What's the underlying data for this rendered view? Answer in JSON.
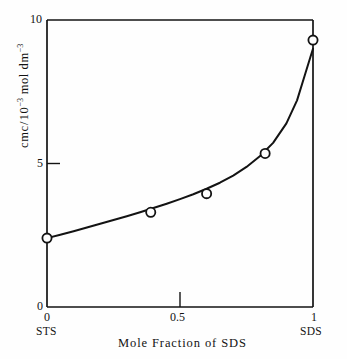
{
  "figure": {
    "background_color": "#fefefe",
    "ink_color": "#131313"
  },
  "axes": {
    "y": {
      "label_prefix": "cmc",
      "label_slash": "/",
      "label_mantissa": "10",
      "label_exponent": "−3",
      "label_unit": " mol dm",
      "label_unit_exponent": "−3",
      "label_plain": "cmc/10−3 mol dm−3",
      "ticks": [
        "0",
        "5",
        "10"
      ],
      "tick_values": [
        0,
        5,
        10
      ],
      "tick_10": "10",
      "tick_5": "5",
      "tick_0": "0",
      "range": [
        0,
        10
      ]
    },
    "x": {
      "label": "Mole Fraction of SDS",
      "ticks": [
        "0",
        "0.5",
        "1"
      ],
      "tick_values": [
        0,
        0.5,
        1
      ],
      "tick_0": "0",
      "tick_05": "0.5",
      "tick_1": "1",
      "endpoint_left": "STS",
      "endpoint_right": "SDS",
      "range": [
        0,
        1
      ]
    }
  },
  "chart_data": {
    "type": "scatter",
    "title": "",
    "xlabel": "Mole Fraction of SDS",
    "ylabel": "cmc/10−3 mol dm−3",
    "xlim": [
      0,
      1
    ],
    "ylim": [
      0,
      10
    ],
    "xticks": [
      0,
      0.5,
      1
    ],
    "xticklabels": [
      "0",
      "0.5",
      "1"
    ],
    "yticks": [
      0,
      5,
      10
    ],
    "yticklabels": [
      "0",
      "5",
      "10"
    ],
    "x_endpoint_labels": {
      "left": "STS",
      "right": "SDS"
    },
    "grid": false,
    "legend": null,
    "marker": "open-circle",
    "series": [
      {
        "name": "cmc of STS/SDS mixtures",
        "marker": "open-circle",
        "x": [
          0.0,
          0.39,
          0.6,
          0.82,
          1.0
        ],
        "y": [
          2.4,
          3.3,
          3.95,
          5.35,
          9.3
        ]
      }
    ],
    "fitted_curve": {
      "name": "smooth fitted curve",
      "x": [
        0.0,
        0.05,
        0.1,
        0.15,
        0.2,
        0.25,
        0.3,
        0.35,
        0.4,
        0.45,
        0.5,
        0.55,
        0.6,
        0.65,
        0.7,
        0.75,
        0.8,
        0.85,
        0.9,
        0.94,
        0.97,
        0.99,
        1.0
      ],
      "y": [
        2.4,
        2.52,
        2.64,
        2.77,
        2.9,
        3.03,
        3.16,
        3.3,
        3.45,
        3.6,
        3.76,
        3.93,
        4.12,
        4.33,
        4.58,
        4.88,
        5.25,
        5.72,
        6.4,
        7.2,
        8.1,
        8.7,
        9.0
      ]
    }
  }
}
